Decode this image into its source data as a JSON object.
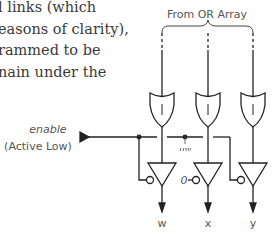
{
  "paragraph": {
    "lines": [
      "l links (which",
      "easons of clarity),",
      "rammed to be",
      "nain under the"
    ]
  },
  "diagram": {
    "title": "From OR Array",
    "enable_label": "enable",
    "enable_sublabel": "(Active Low)",
    "constant_label": "0",
    "gate_symbol": "|",
    "outputs": [
      "w",
      "x",
      "y"
    ],
    "colors": {
      "line": "#222222",
      "text": "#555555"
    }
  }
}
